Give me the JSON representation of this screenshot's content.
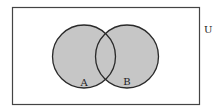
{
  "diagram": {
    "type": "venn",
    "universe_label": "U",
    "sets": [
      {
        "label": "A"
      },
      {
        "label": "B"
      }
    ],
    "shaded_region": "A ∪ B",
    "colors": {
      "shade": "#c6c6c6",
      "stroke": "#2a2a2a",
      "background": "#ffffff"
    }
  }
}
